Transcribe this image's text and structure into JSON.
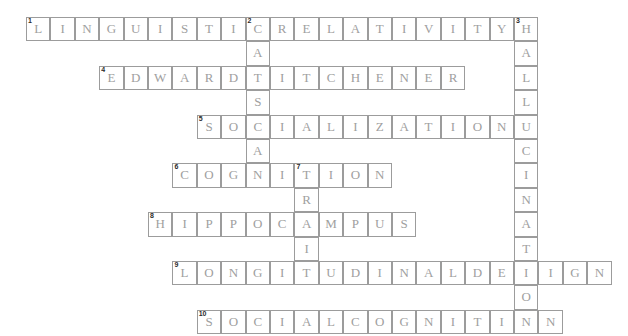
{
  "puzzle": {
    "title": "Psychology Crossword Grid",
    "grid": {
      "origin_x": 26,
      "origin_y": 17,
      "cell_size": 24.4,
      "cols": 24,
      "rows": 14,
      "border_color": "#9c9c9c",
      "letter_color": "#a0a0a0",
      "number_color": "#2b2b2b",
      "background": "#ffffff"
    },
    "entries": [
      {
        "number": "1",
        "direction": "across",
        "answer": "LINGUISTICRELATIVITY",
        "row": 0,
        "col": 0,
        "length": 20
      },
      {
        "number": "2",
        "direction": "down",
        "answer": "CATSCAN",
        "row": 0,
        "col": 9,
        "length": 7
      },
      {
        "number": "3",
        "direction": "down",
        "answer": "HALLUCINATION",
        "row": 0,
        "col": 20,
        "length": 13
      },
      {
        "number": "4",
        "direction": "across",
        "answer": "EDWARDTITCHENER",
        "row": 2,
        "col": 3,
        "length": 15
      },
      {
        "number": "5",
        "direction": "across",
        "answer": "SOCIALIZATION",
        "row": 4,
        "col": 7,
        "length": 13
      },
      {
        "number": "6",
        "direction": "across",
        "answer": "COGNITION",
        "row": 6,
        "col": 6,
        "length": 9
      },
      {
        "number": "7",
        "direction": "down",
        "answer": "TRAIT",
        "row": 6,
        "col": 11,
        "length": 5
      },
      {
        "number": "8",
        "across": true,
        "direction": "across",
        "answer": "HIPPOCAMPUS",
        "row": 8,
        "col": 5,
        "length": 11
      },
      {
        "number": "9",
        "direction": "across",
        "answer": "LONGITUDINALDESIGN",
        "row": 10,
        "col": 6,
        "length": 18
      },
      {
        "number": "10",
        "direction": "across",
        "answer": "SOCIALCOGNITION",
        "row": 12,
        "col": 7,
        "length": 15
      }
    ],
    "numbered_cells": [
      {
        "number": "1",
        "row": 0,
        "col": 0
      },
      {
        "number": "2",
        "row": 0,
        "col": 9
      },
      {
        "number": "3",
        "row": 0,
        "col": 20
      },
      {
        "number": "4",
        "row": 2,
        "col": 3
      },
      {
        "number": "5",
        "row": 4,
        "col": 7
      },
      {
        "number": "6",
        "row": 6,
        "col": 6
      },
      {
        "number": "7",
        "row": 6,
        "col": 11
      },
      {
        "number": "8",
        "row": 8,
        "col": 5
      },
      {
        "number": "9",
        "row": 10,
        "col": 6
      },
      {
        "number": "10",
        "row": 12,
        "col": 7
      }
    ]
  }
}
